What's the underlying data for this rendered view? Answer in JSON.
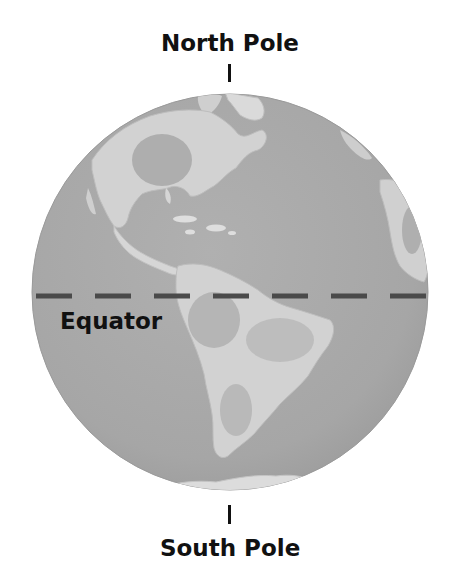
{
  "diagram": {
    "labels": {
      "north_pole": "North Pole",
      "south_pole": "South Pole",
      "equator": "Equator"
    },
    "globe": {
      "center_x": 230,
      "center_y": 292,
      "radius": 198,
      "ocean_color": "#a9a9a9",
      "land_color": "#d4d4d4",
      "land_highlight_color": "#e6e6e6",
      "land_shadow_color": "#8f8f8f"
    },
    "equator_line": {
      "y": 296,
      "x_start": 36,
      "x_end": 428,
      "dash_length": 36,
      "gap_length": 23,
      "color": "#4a4a4a"
    },
    "visible_landmasses": [
      "North America",
      "Central America",
      "Caribbean islands",
      "South America",
      "Greenland (partial)",
      "Western Africa/Europe edge (partial)",
      "Antarctica (partial)"
    ]
  }
}
